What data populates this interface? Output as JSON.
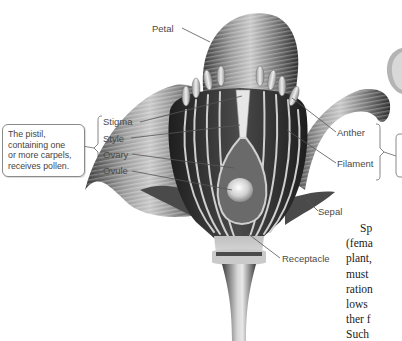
{
  "diagram": {
    "labels": {
      "petal": "Petal",
      "stigma": "Stigma",
      "style": "Style",
      "ovary": "Ovary",
      "ovule": "Ovule",
      "anther": "Anther",
      "filament": "Filament",
      "sepal": "Sepal",
      "receptacle": "Receptacle"
    },
    "pistil_callout": {
      "lines": [
        "The pistil,",
        "containing one",
        "or more carpels,",
        "receives pollen."
      ]
    }
  },
  "body_text": {
    "lines": [
      "Sp",
      "(fema",
      "plant,",
      "must",
      "ration",
      "lows",
      "ther f",
      "Such"
    ]
  }
}
